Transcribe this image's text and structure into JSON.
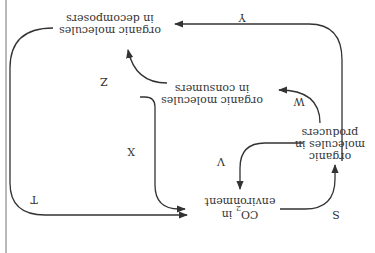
{
  "diagram": {
    "orientation_degrees": 180,
    "colors": {
      "stroke": "#333333",
      "text": "#333333",
      "left_rule": "#b9b9b9",
      "background": "#ffffff"
    },
    "nodes": {
      "co2": {
        "line1": "CO",
        "subscript": "2",
        "line1_suffix": " in",
        "line2": "environment"
      },
      "producers": {
        "line1": "organic",
        "line2": "molecules in",
        "line3": "producers"
      },
      "consumers": {
        "line1": "organic molecules",
        "line2": "in consumers"
      },
      "decomposers": {
        "line1": "organic molecules",
        "line2": "in decomposers"
      }
    },
    "edges": [
      {
        "id": "S",
        "label": "S",
        "from": "CO2 in environment",
        "to": "organic molecules in producers"
      },
      {
        "id": "V",
        "label": "V",
        "from": "organic molecules in producers",
        "to": "CO2 in environment"
      },
      {
        "id": "W",
        "label": "W",
        "from": "organic molecules in producers",
        "to": "organic molecules in consumers"
      },
      {
        "id": "X",
        "label": "X",
        "from": "organic molecules in consumers",
        "to": "CO2 in environment"
      },
      {
        "id": "Y",
        "label": "Y",
        "from": "organic molecules in producers",
        "to": "organic molecules in decomposers"
      },
      {
        "id": "Z",
        "label": "Z",
        "from": "organic molecules in consumers",
        "to": "organic molecules in decomposers"
      },
      {
        "id": "T",
        "label": "T",
        "from": "organic molecules in decomposers",
        "to": "CO2 in environment"
      }
    ]
  }
}
